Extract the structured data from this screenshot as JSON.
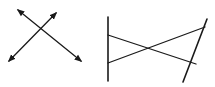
{
  "diagram": {
    "figures": [
      {
        "id": "intersecting-lines",
        "type": "two crossing lines with arrows on both ends",
        "line_count": 2
      },
      {
        "id": "transversals",
        "type": "two non-parallel lines cut by two crossing segments",
        "line_count": 4
      }
    ],
    "colors": {
      "stroke": "#1a1a1a",
      "background": "#ffffff"
    }
  }
}
